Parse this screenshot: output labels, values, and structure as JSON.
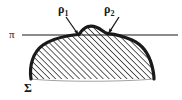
{
  "figure": {
    "background_color": "#ffffff",
    "ink_color": "#1a1a1a",
    "labels": {
      "plane": "π",
      "surface": "Σ",
      "point1_base": "ρ",
      "point1_sub": "1",
      "point2_base": "ρ",
      "point2_sub": "2"
    },
    "elements": {
      "plane_line_name": "plane-pi-line",
      "surface_region_name": "surface-sigma-region",
      "hatch_name": "diagonal-hatch-fill",
      "arrow1_name": "arrow-to-rho1",
      "arrow2_name": "arrow-to-rho2"
    },
    "geometry": {
      "plane_y": 35,
      "plane_x_start": 22,
      "plane_x_end": 178,
      "rho1_point": [
        78,
        35
      ],
      "rho2_point": [
        108,
        33
      ],
      "hatch_angle_deg": 45,
      "hatch_spacing_px": 3
    }
  }
}
